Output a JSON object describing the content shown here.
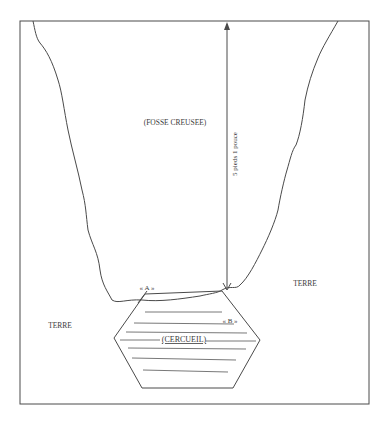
{
  "diagram": {
    "labels": {
      "pit": "(FOSSE CREUSEE)",
      "depth": "5 pieds 1 pouce",
      "earth_right": "TERRE",
      "earth_left": "TERRE",
      "point_a": "« A »",
      "point_b": "« B »",
      "coffin": "(CERCUEIL)"
    },
    "colors": {
      "line": "#4a4a4a",
      "background": "#ffffff"
    }
  }
}
